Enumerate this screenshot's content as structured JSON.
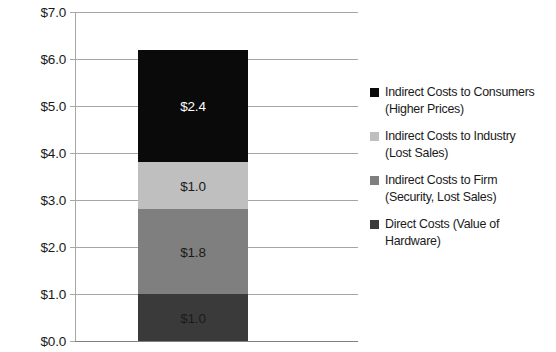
{
  "chart_data": {
    "type": "bar",
    "subtype": "stacked-bar-single-category",
    "title": "",
    "xlabel": "",
    "ylabel": "",
    "categories": [
      ""
    ],
    "ylim": [
      0.0,
      7.0
    ],
    "ytick_step": 1.0,
    "ytick_labels": [
      "$7.0",
      "$6.0",
      "$5.0",
      "$4.0",
      "$3.0",
      "$2.0",
      "$1.0",
      "$0.0"
    ],
    "ytick_values": [
      7.0,
      6.0,
      5.0,
      4.0,
      3.0,
      2.0,
      1.0,
      0.0
    ],
    "grid": true,
    "legend_position": "right",
    "total": 6.2,
    "stack_order_bottom_to_top": [
      "Direct Costs (Value of Hardware)",
      "Indirect Costs to Firm (Security, Lost Sales)",
      "Indirect Costs to Industry (Lost Sales)",
      "Indirect Costs to Consumers (Higher Prices)"
    ],
    "series": [
      {
        "name": "Indirect Costs to Consumers (Higher Prices)",
        "legend_line1": "Indirect Costs to Consumers",
        "legend_line2": "(Higher Prices)",
        "value": 2.4,
        "data_label": "$2.4",
        "color": "#0a0a0a",
        "label_color": "#ffffff"
      },
      {
        "name": "Indirect Costs to Industry (Lost Sales)",
        "legend_line1": "Indirect Costs to Industry",
        "legend_line2": "(Lost Sales)",
        "value": 1.0,
        "data_label": "$1.0",
        "color": "#bfbfbf",
        "label_color": "#1a1a1a"
      },
      {
        "name": "Indirect Costs to Firm (Security, Lost Sales)",
        "legend_line1": "Indirect Costs to Firm",
        "legend_line2": "(Security, Lost Sales)",
        "value": 1.8,
        "data_label": "$1.8",
        "color": "#7f7f7f",
        "label_color": "#1a1a1a"
      },
      {
        "name": "Direct Costs (Value of Hardware)",
        "legend_line1": "Direct Costs (Value of",
        "legend_line2": "Hardware)",
        "value": 1.0,
        "data_label": "$1.0",
        "color": "#3a3a3a",
        "label_color": "#1a1a1a"
      }
    ]
  },
  "colors": {
    "gridline": "#a6a6a6",
    "axis": "#808080",
    "text": "#1a1a1a",
    "background": "#ffffff"
  }
}
